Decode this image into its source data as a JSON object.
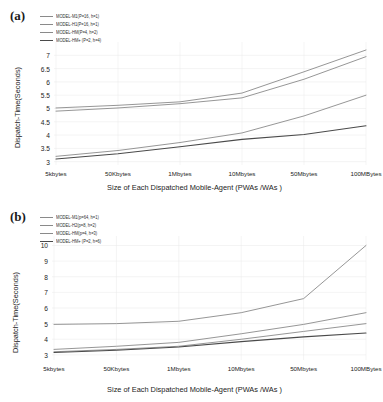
{
  "figure": {
    "background": "#ffffff",
    "panels": [
      {
        "tag": "(a)",
        "xlabel": "Size of Each Dispatched Mobile-Agent (PWAs /WAs )",
        "ylabel": "Dispatch-Time(Seconds)"
      },
      {
        "tag": "(b)",
        "xlabel": "Size of Each Dispatched Mobile-Agent (PWAs /WAs )",
        "ylabel": "Dispatch-Time(Seconds)"
      }
    ]
  },
  "chart_data": [
    {
      "type": "line",
      "title": "(a)",
      "xlabel": "Size of Each Dispatched Mobile-Agent (PWAs /WAs )",
      "ylabel": "Dispatch-Time(Seconds)",
      "categories": [
        "5kbytes",
        "50Kbytes",
        "1Mbytes",
        "10Mbytes",
        "50Mbytes",
        "100MBytes"
      ],
      "yticks": [
        3,
        3.5,
        4,
        4.5,
        5,
        5.5,
        6,
        6.5,
        7
      ],
      "ylim": [
        2.95,
        7.35
      ],
      "grid": true,
      "legend_position": "top-left",
      "series": [
        {
          "name": "MODEL-M1(P=16, h=1)",
          "color": "#8a8a8a",
          "width": 0.9,
          "values": [
            5.02,
            5.12,
            5.25,
            5.58,
            6.38,
            7.2
          ]
        },
        {
          "name": "MODEL-H1(P=16, h=1)",
          "color": "#8a8a8a",
          "width": 0.9,
          "values": [
            4.9,
            5.02,
            5.18,
            5.4,
            6.1,
            6.95
          ]
        },
        {
          "name": "MODEL-HM(P=4, h=2)",
          "color": "#8a8a8a",
          "width": 0.9,
          "values": [
            3.2,
            3.42,
            3.72,
            4.08,
            4.72,
            5.5
          ]
        },
        {
          "name": "MODEL-HM+ (P=2, h=4)",
          "color": "#4a4a4a",
          "width": 1.1,
          "values": [
            3.1,
            3.3,
            3.56,
            3.84,
            4.02,
            4.35
          ]
        }
      ]
    },
    {
      "type": "line",
      "title": "(b)",
      "xlabel": "Size of Each Dispatched Mobile-Agent (PWAs /WAs )",
      "ylabel": "Dispatch-Time(Seconds)",
      "categories": [
        "5kbytes",
        "50Kbytes",
        "1Mbytes",
        "10Mbytes",
        "50Mbytes",
        "100MBytes"
      ],
      "yticks": [
        3,
        4,
        5,
        6,
        7,
        8,
        9,
        10
      ],
      "ylim": [
        2.8,
        10.35
      ],
      "grid": true,
      "legend_position": "top-left",
      "series": [
        {
          "name": "MODEL-M1(p=64, h=1)",
          "color": "#8a8a8a",
          "width": 0.9,
          "values": [
            4.95,
            5.0,
            5.15,
            5.7,
            6.6,
            10.0
          ]
        },
        {
          "name": "MODEL-H2(p=8, h=2)",
          "color": "#8a8a8a",
          "width": 0.9,
          "values": [
            3.35,
            3.55,
            3.8,
            4.35,
            4.95,
            5.7
          ]
        },
        {
          "name": "MODEL-HM(p=4, h=3)",
          "color": "#8a8a8a",
          "width": 0.9,
          "values": [
            3.2,
            3.35,
            3.55,
            4.0,
            4.5,
            5.0
          ]
        },
        {
          "name": "MODEL-HM+ (P=2, h=6)",
          "color": "#4a4a4a",
          "width": 1.1,
          "values": [
            3.15,
            3.3,
            3.5,
            3.85,
            4.15,
            4.4
          ]
        }
      ]
    }
  ]
}
